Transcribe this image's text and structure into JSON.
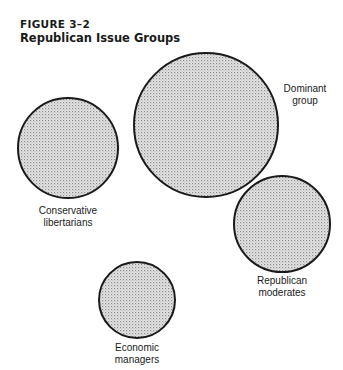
{
  "figure": {
    "number": "FIGURE  3–2",
    "title": "Republican Issue Groups"
  },
  "groups": [
    {
      "name": "Dominant group",
      "line1": "Dominant",
      "line2": "group",
      "cx": 206,
      "cy": 125,
      "r": 72
    },
    {
      "name": "Conservative libertarians",
      "line1": "Conservative",
      "line2": "libertarians",
      "cx": 68,
      "cy": 148,
      "r": 50
    },
    {
      "name": "Republican moderates",
      "line1": "Republican",
      "line2": "moderates",
      "cx": 282,
      "cy": 224,
      "r": 48
    },
    {
      "name": "Economic managers",
      "line1": "Economic",
      "line2": "managers",
      "cx": 137,
      "cy": 300,
      "r": 38
    }
  ],
  "colors": {
    "fill": "#cfcfcf",
    "stroke": "#1a1a1a"
  }
}
